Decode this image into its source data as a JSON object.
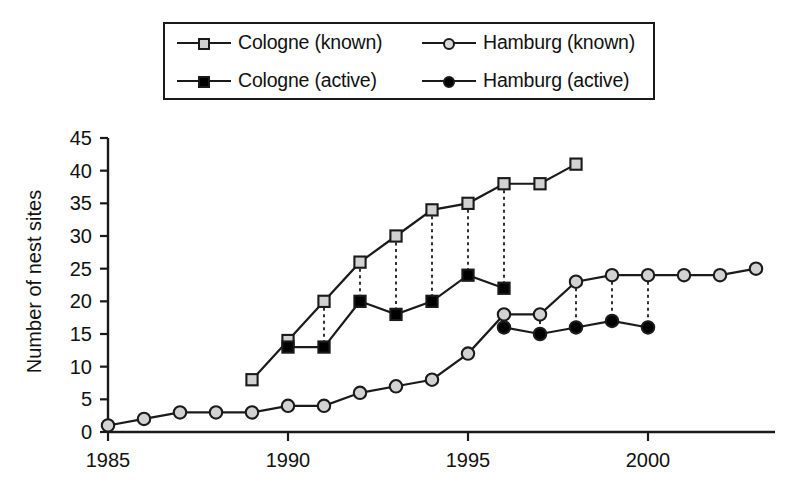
{
  "legend": {
    "entries": [
      {
        "label": "Cologne (known)",
        "marker": "square-gray-icon"
      },
      {
        "label": "Hamburg (known)",
        "marker": "circle-gray-icon"
      },
      {
        "label": "Cologne (active)",
        "marker": "square-black-icon"
      },
      {
        "label": "Hamburg (active)",
        "marker": "circle-black-icon"
      }
    ]
  },
  "axes": {
    "ylabel": "Number of nest sites",
    "yticks": [
      "0",
      "5",
      "10",
      "15",
      "20",
      "25",
      "30",
      "35",
      "40",
      "45"
    ],
    "xticks": [
      "1985",
      "1990",
      "1995",
      "2000"
    ]
  },
  "colors": {
    "line": "#1a1a1a",
    "known_fill": "#d2d2d2",
    "active_fill": "#000000",
    "background": "#ffffff"
  },
  "chart_data": {
    "type": "line",
    "title": "",
    "xlabel": "",
    "ylabel": "Number of nest sites",
    "xlim": [
      1985,
      2003
    ],
    "ylim": [
      0,
      45
    ],
    "ytick_step": 5,
    "xtick_values": [
      1985,
      1990,
      1995,
      2000
    ],
    "grid": false,
    "legend_position": "top-center",
    "connectors": {
      "style": "dotted-vertical",
      "description": "dotted vertical lines join known and active values of the same city and year",
      "pairs": [
        {
          "city": "Cologne",
          "year": 1991,
          "known": 20,
          "active": 13
        },
        {
          "city": "Cologne",
          "year": 1992,
          "known": 26,
          "active": 20
        },
        {
          "city": "Cologne",
          "year": 1993,
          "known": 30,
          "active": 18
        },
        {
          "city": "Cologne",
          "year": 1994,
          "known": 34,
          "active": 20
        },
        {
          "city": "Cologne",
          "year": 1995,
          "known": 35,
          "active": 24
        },
        {
          "city": "Cologne",
          "year": 1996,
          "known": 38,
          "active": 22
        },
        {
          "city": "Hamburg",
          "year": 1996,
          "known": 18,
          "active": 16
        },
        {
          "city": "Hamburg",
          "year": 1997,
          "known": 18,
          "active": 15
        },
        {
          "city": "Hamburg",
          "year": 1998,
          "known": 23,
          "active": 16
        },
        {
          "city": "Hamburg",
          "year": 1999,
          "known": 24,
          "active": 17
        },
        {
          "city": "Hamburg",
          "year": 2000,
          "known": 24,
          "active": 16
        }
      ]
    },
    "series": [
      {
        "name": "Cologne (known)",
        "marker": "square",
        "fill": "#d2d2d2",
        "x": [
          1989,
          1990,
          1991,
          1992,
          1993,
          1994,
          1995,
          1996,
          1997,
          1998
        ],
        "values": [
          8,
          14,
          20,
          26,
          30,
          34,
          35,
          38,
          38,
          41
        ]
      },
      {
        "name": "Cologne (active)",
        "marker": "square",
        "fill": "#000000",
        "x": [
          1990,
          1991,
          1992,
          1993,
          1994,
          1995,
          1996
        ],
        "values": [
          13,
          13,
          20,
          18,
          20,
          24,
          22
        ]
      },
      {
        "name": "Hamburg (known)",
        "marker": "circle",
        "fill": "#d2d2d2",
        "x": [
          1985,
          1986,
          1987,
          1988,
          1989,
          1990,
          1991,
          1992,
          1993,
          1994,
          1995,
          1996,
          1997,
          1998,
          1999,
          2000,
          2001,
          2002,
          2003
        ],
        "values": [
          1,
          2,
          3,
          3,
          3,
          4,
          4,
          6,
          7,
          8,
          12,
          18,
          18,
          23,
          24,
          24,
          24,
          24,
          25
        ]
      },
      {
        "name": "Hamburg (active)",
        "marker": "circle",
        "fill": "#000000",
        "x": [
          1996,
          1997,
          1998,
          1999,
          2000
        ],
        "values": [
          16,
          15,
          16,
          17,
          16
        ]
      }
    ]
  }
}
